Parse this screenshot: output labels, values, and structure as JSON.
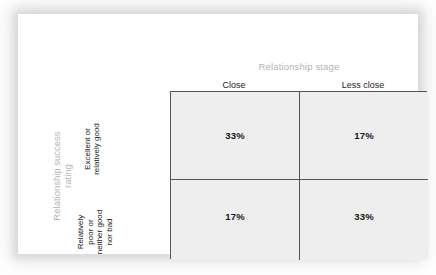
{
  "chart_data": {
    "type": "table",
    "title": "",
    "xlabel": "Relationship stage",
    "ylabel": "Relationship success rating",
    "categories": [
      "Close",
      "Less close"
    ],
    "row_categories": [
      "Excellent or relatively good",
      "Relatively poor or neither good nor bad"
    ],
    "values": [
      [
        33,
        17
      ],
      [
        17,
        33
      ]
    ],
    "value_labels": [
      [
        "33%",
        "17%"
      ],
      [
        "17%",
        "33%"
      ]
    ],
    "unit": "%",
    "grid": true,
    "legend": "none",
    "colors": {
      "cell_fill": "#eeeeee",
      "grid_line": "#545454",
      "axis_title": "#b4b4b4",
      "label_text": "#1a1a1a",
      "value_text": "#141414",
      "card_background": "#ffffff"
    }
  },
  "column_axis": {
    "title": "Relationship stage",
    "headers": [
      {
        "label": "Close"
      },
      {
        "label": "Less close"
      }
    ]
  },
  "row_axis": {
    "title_lines": [
      "Relationship success",
      "rating"
    ],
    "headers": [
      {
        "lines": [
          "Excellent or",
          "relatively good"
        ]
      },
      {
        "lines": [
          "Relatively",
          "poor or",
          "neither good",
          "nor bad"
        ]
      }
    ]
  },
  "matrix": {
    "rows": [
      {
        "cells": [
          {
            "value": "33%"
          },
          {
            "value": "17%"
          }
        ]
      },
      {
        "cells": [
          {
            "value": "17%"
          },
          {
            "value": "33%"
          }
        ]
      }
    ]
  }
}
